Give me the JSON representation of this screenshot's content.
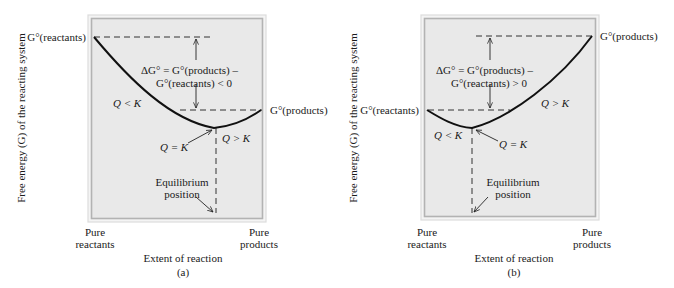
{
  "colors": {
    "panel_fill": "#e9e9e9",
    "frame_outer": "#dcdcdc",
    "frame_inner": "#b3b3b3",
    "curve": "#111111",
    "dash": "#333333"
  },
  "y_axis_label": "Free energy (G) of the reacting system",
  "x_axis_label": "Extent of reaction",
  "x_left_label": [
    "Pure",
    "reactants"
  ],
  "x_right_label": [
    "Pure",
    "products"
  ],
  "panels": [
    {
      "id": "a",
      "caption": "(a)",
      "g_reactants_label": "G°(reactants)",
      "g_products_label": "G°(products)",
      "delta_g_line1": "ΔG° = G°(products) –",
      "delta_g_line2": "G°(reactants) < 0",
      "region_left": "Q < K",
      "region_right": "Q > K",
      "equilibrium_label": "Q = K",
      "equilibrium_position": [
        "Equilibrium",
        "position"
      ]
    },
    {
      "id": "b",
      "caption": "(b)",
      "g_reactants_label": "G°(reactants)",
      "g_products_label": "G°(products)",
      "delta_g_line1": "ΔG° = G°(products) –",
      "delta_g_line2": "G°(reactants) > 0",
      "region_left": "Q < K",
      "region_right": "Q > K",
      "equilibrium_label": "Q = K",
      "equilibrium_position": [
        "Equilibrium",
        "position"
      ]
    }
  ]
}
